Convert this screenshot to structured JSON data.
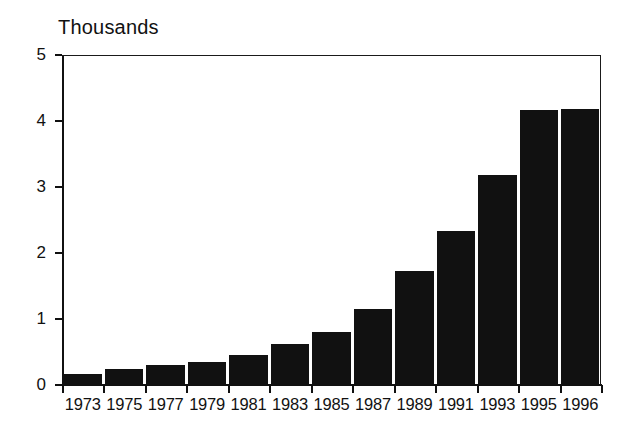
{
  "chart_data": {
    "type": "bar",
    "title": "Thousands",
    "xlabel": "",
    "ylabel": "",
    "categories": [
      "1973",
      "1975",
      "1977",
      "1979",
      "1981",
      "1983",
      "1985",
      "1987",
      "1989",
      "1991",
      "1993",
      "1995",
      "1996"
    ],
    "values": [
      0.17,
      0.24,
      0.3,
      0.35,
      0.46,
      0.62,
      0.81,
      1.15,
      1.72,
      2.33,
      3.18,
      4.17,
      4.18
    ],
    "ylim": [
      0,
      5
    ],
    "ytick_labels": [
      "0",
      "1",
      "2",
      "3",
      "4",
      "5"
    ],
    "ytick_values": [
      0,
      1,
      2,
      3,
      4,
      5
    ],
    "grid": false,
    "legend": "none",
    "bar_color": "#111111",
    "axis_color": "#111111",
    "background_color": "#ffffff"
  }
}
